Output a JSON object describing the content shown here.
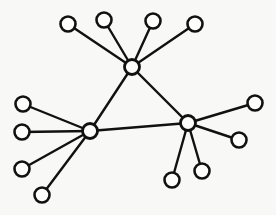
{
  "diagram": {
    "type": "node-link-graph",
    "canvas": {
      "width": 276,
      "height": 215,
      "background": "#f8f8f6"
    },
    "style": {
      "edge_color": "#111111",
      "edge_width": 2.4,
      "node_fill": "#fdfdfb",
      "node_stroke": "#111111",
      "node_stroke_width": 2.6,
      "hub_radius": 7.5,
      "leaf_radius": 7.5
    },
    "nodes": [
      {
        "id": "hub-top",
        "label": "",
        "role": "hub",
        "x": 132,
        "y": 67,
        "r": 7.5,
        "degree": 6
      },
      {
        "id": "hub-left",
        "label": "",
        "role": "hub",
        "x": 90,
        "y": 131,
        "r": 7.5,
        "degree": 6
      },
      {
        "id": "hub-right",
        "label": "",
        "role": "hub",
        "x": 188,
        "y": 123,
        "r": 7.5,
        "degree": 6
      },
      {
        "id": "leaf-t1",
        "label": "",
        "role": "leaf",
        "x": 68,
        "y": 24,
        "r": 7.5,
        "degree": 1
      },
      {
        "id": "leaf-t2",
        "label": "",
        "role": "leaf",
        "x": 104,
        "y": 20,
        "r": 7.5,
        "degree": 1
      },
      {
        "id": "leaf-t3",
        "label": "",
        "role": "leaf",
        "x": 153,
        "y": 21,
        "r": 7.5,
        "degree": 1
      },
      {
        "id": "leaf-t4",
        "label": "",
        "role": "leaf",
        "x": 195,
        "y": 24,
        "r": 7.5,
        "degree": 1
      },
      {
        "id": "leaf-l1",
        "label": "",
        "role": "leaf",
        "x": 23,
        "y": 104,
        "r": 7.5,
        "degree": 1
      },
      {
        "id": "leaf-l2",
        "label": "",
        "role": "leaf",
        "x": 22,
        "y": 132,
        "r": 7.5,
        "degree": 1
      },
      {
        "id": "leaf-l3",
        "label": "",
        "role": "leaf",
        "x": 22,
        "y": 169,
        "r": 7.5,
        "degree": 1
      },
      {
        "id": "leaf-l4",
        "label": "",
        "role": "leaf",
        "x": 42,
        "y": 195,
        "r": 7.5,
        "degree": 1
      },
      {
        "id": "leaf-r1",
        "label": "",
        "role": "leaf",
        "x": 255,
        "y": 103,
        "r": 7.5,
        "degree": 1
      },
      {
        "id": "leaf-r2",
        "label": "",
        "role": "leaf",
        "x": 239,
        "y": 140,
        "r": 7.5,
        "degree": 1
      },
      {
        "id": "leaf-r3",
        "label": "",
        "role": "leaf",
        "x": 202,
        "y": 171,
        "r": 7.5,
        "degree": 1
      },
      {
        "id": "leaf-r4",
        "label": "",
        "role": "leaf",
        "x": 172,
        "y": 180,
        "r": 7.5,
        "degree": 1
      }
    ],
    "edges": [
      {
        "id": "edge-hub-top-hub-left",
        "source": "hub-top",
        "target": "hub-left"
      },
      {
        "id": "edge-hub-top-hub-right",
        "source": "hub-top",
        "target": "hub-right"
      },
      {
        "id": "edge-hub-left-hub-right",
        "source": "hub-left",
        "target": "hub-right"
      },
      {
        "id": "edge-hub-top-leaf-t1",
        "source": "hub-top",
        "target": "leaf-t1"
      },
      {
        "id": "edge-hub-top-leaf-t2",
        "source": "hub-top",
        "target": "leaf-t2"
      },
      {
        "id": "edge-hub-top-leaf-t3",
        "source": "hub-top",
        "target": "leaf-t3"
      },
      {
        "id": "edge-hub-top-leaf-t4",
        "source": "hub-top",
        "target": "leaf-t4"
      },
      {
        "id": "edge-hub-left-leaf-l1",
        "source": "hub-left",
        "target": "leaf-l1"
      },
      {
        "id": "edge-hub-left-leaf-l2",
        "source": "hub-left",
        "target": "leaf-l2"
      },
      {
        "id": "edge-hub-left-leaf-l3",
        "source": "hub-left",
        "target": "leaf-l3"
      },
      {
        "id": "edge-hub-left-leaf-l4",
        "source": "hub-left",
        "target": "leaf-l4"
      },
      {
        "id": "edge-hub-right-leaf-r1",
        "source": "hub-right",
        "target": "leaf-r1"
      },
      {
        "id": "edge-hub-right-leaf-r2",
        "source": "hub-right",
        "target": "leaf-r2"
      },
      {
        "id": "edge-hub-right-leaf-r3",
        "source": "hub-right",
        "target": "leaf-r3"
      },
      {
        "id": "edge-hub-right-leaf-r4",
        "source": "hub-right",
        "target": "leaf-r4"
      }
    ]
  }
}
